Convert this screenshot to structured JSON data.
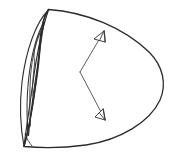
{
  "figure": {
    "canvas": {
      "width": 174,
      "height": 157
    },
    "background_color": "#ffffff",
    "stroke_color": "#2b2b2b",
    "secondary_stroke_color": "#4a4a4a",
    "arrow_fill_color": "#ffffff"
  },
  "shapes": {
    "outer_body": {
      "name": "outer-ovoid-outline",
      "description": "Large rounded teardrop / egg outline, pointed at upper-left and lower-left, bulging to the right",
      "path": "M 48.5 9.5 C 86 12 124 28 149 52 C 163 66 167 84 160 100 C 150 122 120 140 86 145 C 64 148 40 148 24 146.5 C 32 120 38 70 40 40 C 41.5 26 44 15 48.5 9.5 Z",
      "stroke_width": 1.3
    },
    "rim_edge": {
      "name": "rim-edge-curve",
      "description": "Inner rim curve running from top apex down to bottom apex, forming the mouth opening",
      "path": "M 48.5 9.5 C 44 16 41.5 28 40.5 42 C 39 72 31 118 24 146.5",
      "stroke_width": 1.2
    },
    "cavity_outer": {
      "name": "cavity-outer-contour",
      "description": "Leaf / lens shaped outer contour of the concave interior on the left side",
      "path": "M 48.5 10 C 36 22 26 50 22 82 C 19.5 104 20.5 128 24 146.5 C 26.5 126 30 104 33 82 C 37 52 43 26 48.5 10 Z",
      "stroke_width": 1.1
    },
    "cavity_inner": {
      "name": "cavity-inner-contour",
      "description": "Inner narrow lens outline nested inside the cavity, the recessed core",
      "path": "M 44 22 C 36.5 34 31 56 28.5 80 C 26.5 100 26.5 120 28.5 136 C 30.5 116 33 94 36 76 C 39 56 42 36 44 22 Z",
      "stroke_width": 1.0
    },
    "cavity_detail_1": {
      "name": "cavity-ridge-line-1",
      "description": "Thin ridge line inside the cavity following the core contour",
      "path": "M 42.5 26 C 36 40 32 58 30.5 76 C 29.5 92 29.5 110 30.5 126",
      "stroke_width": 0.8
    },
    "cavity_detail_2": {
      "name": "cavity-ridge-line-2",
      "description": "Second thin ridge line, slight jog near the upper third",
      "path": "M 40 33 C 36.5 41 34.5 48 34 54 C 33.5 58 35 60 34.5 64 C 33.5 72 32.5 84 32 96",
      "stroke_width": 0.8
    },
    "cavity_detail_3": {
      "name": "cavity-base-line",
      "description": "Short line near the lower tip of the cavity closing the core",
      "path": "M 25 134 C 27 139 29.5 143 32 146",
      "stroke_width": 0.8
    }
  },
  "callouts": {
    "vertex": {
      "x": 80,
      "y": 72,
      "name": "callout-vertex"
    },
    "items": [
      {
        "name": "callout-arrow-upper",
        "label": "",
        "leader_path": "M 80 72 L 100 38",
        "head_points": "104,31 94,39 105,42",
        "head_detail_path": "M 104 31 L 105 42 M 104 31 L 99.5 40.5",
        "direction": "down-left",
        "tip": {
          "x": 94,
          "y": 39
        }
      },
      {
        "name": "callout-arrow-lower",
        "label": "",
        "leader_path": "M 80 72 L 101 112",
        "head_points": "105,120 95,117 103,109",
        "head_detail_path": "M 105 120 L 103 109 M 105 120 L 99.5 113",
        "direction": "up-left",
        "tip": {
          "x": 95,
          "y": 117
        }
      }
    ]
  }
}
